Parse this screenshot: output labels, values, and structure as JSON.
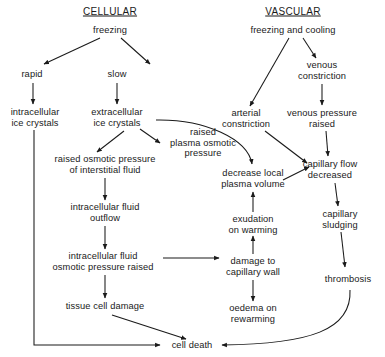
{
  "diagram": {
    "title_cellular": "CELLULAR",
    "title_vascular": "VASCULAR",
    "headings": [
      {
        "id": "cellular",
        "label": "CELLULAR",
        "x": 110,
        "y": 11
      },
      {
        "id": "vascular",
        "label": "VASCULAR",
        "x": 293,
        "y": 11
      }
    ],
    "nodes": [
      {
        "id": "freezing",
        "label": "freezing",
        "x": 110,
        "y": 30
      },
      {
        "id": "rapid",
        "label": "rapid",
        "x": 32,
        "y": 74
      },
      {
        "id": "slow",
        "label": "slow",
        "x": 117,
        "y": 74
      },
      {
        "id": "intracellular-ice-crystals",
        "label": "intracellular\nice crystals",
        "x": 35,
        "y": 117
      },
      {
        "id": "extracellular-ice-crystals",
        "label": "extracellular\nice crystals",
        "x": 117,
        "y": 117
      },
      {
        "id": "raised-plasma-osmotic-pressure",
        "label": "raised\nplasma osmotic\npressure",
        "x": 203,
        "y": 143
      },
      {
        "id": "raised-osmotic-pressure-interstitial",
        "label": "raised osmotic pressure\nof interstitial fluid",
        "x": 105,
        "y": 164
      },
      {
        "id": "intracellular-fluid-outflow",
        "label": "intracellular fluid\noutflow",
        "x": 105,
        "y": 212
      },
      {
        "id": "intracellular-fluid-osmotic-pressure-raised",
        "label": "intracellular fluid\nosmotic pressure raised",
        "x": 103,
        "y": 261
      },
      {
        "id": "tissue-cell-damage",
        "label": "tissue cell damage",
        "x": 105,
        "y": 306
      },
      {
        "id": "cell-death",
        "label": "cell death",
        "x": 192,
        "y": 345
      },
      {
        "id": "freezing-and-cooling",
        "label": "freezing and cooling",
        "x": 293,
        "y": 30
      },
      {
        "id": "venous-constriction",
        "label": "venous\nconstriction",
        "x": 322,
        "y": 70
      },
      {
        "id": "arterial-constriction",
        "label": "arterial\nconstriction",
        "x": 246,
        "y": 118
      },
      {
        "id": "venous-pressure-raised",
        "label": "venous pressure\nraised",
        "x": 322,
        "y": 118
      },
      {
        "id": "capillary-flow-decreased",
        "label": "capillary flow\ndecreased",
        "x": 330,
        "y": 169
      },
      {
        "id": "decrease-local-plasma-volume",
        "label": "decrease local\nplasma volume",
        "x": 253,
        "y": 178
      },
      {
        "id": "exudation-on-warming",
        "label": "exudation\non warming",
        "x": 253,
        "y": 224
      },
      {
        "id": "damage-to-capillary-wall",
        "label": "damage to\ncapillary wall",
        "x": 253,
        "y": 266
      },
      {
        "id": "oedema-on-rewarming",
        "label": "oedema on\nrewarming",
        "x": 253,
        "y": 313
      },
      {
        "id": "capillary-sludging",
        "label": "capillary\nsludging",
        "x": 340,
        "y": 219
      },
      {
        "id": "thrombosis",
        "label": "thrombosis",
        "x": 348,
        "y": 279
      }
    ],
    "edges": [
      {
        "id": "freezing-to-rapid",
        "from": "freezing",
        "to": "rapid"
      },
      {
        "id": "freezing-to-slow",
        "from": "freezing",
        "to": "slow"
      },
      {
        "id": "rapid-to-intracellular",
        "from": "rapid",
        "to": "intracellular-ice-crystals"
      },
      {
        "id": "slow-to-extracellular",
        "from": "slow",
        "to": "extracellular-ice-crystals"
      },
      {
        "id": "extracellular-to-raised-plasma",
        "from": "extracellular-ice-crystals",
        "to": "raised-plasma-osmotic-pressure"
      },
      {
        "id": "extracellular-to-interstitial",
        "from": "extracellular-ice-crystals",
        "to": "raised-osmotic-pressure-interstitial"
      },
      {
        "id": "extracellular-to-decrease-local",
        "from": "extracellular-ice-crystals",
        "to": "decrease-local-plasma-volume"
      },
      {
        "id": "interstitial-to-outflow",
        "from": "raised-osmotic-pressure-interstitial",
        "to": "intracellular-fluid-outflow"
      },
      {
        "id": "outflow-to-osmotic-raised",
        "from": "intracellular-fluid-outflow",
        "to": "intracellular-fluid-osmotic-pressure-raised"
      },
      {
        "id": "osmotic-raised-to-tissue-damage",
        "from": "intracellular-fluid-osmotic-pressure-raised",
        "to": "tissue-cell-damage"
      },
      {
        "id": "osmotic-raised-to-capillary-wall",
        "from": "intracellular-fluid-osmotic-pressure-raised",
        "to": "damage-to-capillary-wall"
      },
      {
        "id": "tissue-damage-to-cell-death",
        "from": "tissue-cell-damage",
        "to": "cell-death"
      },
      {
        "id": "intracellular-ice-to-cell-death",
        "from": "intracellular-ice-crystals",
        "to": "cell-death"
      },
      {
        "id": "freezing-cooling-to-arterial",
        "from": "freezing-and-cooling",
        "to": "arterial-constriction"
      },
      {
        "id": "freezing-cooling-to-venous",
        "from": "freezing-and-cooling",
        "to": "venous-constriction"
      },
      {
        "id": "venous-constriction-to-pressure",
        "from": "venous-constriction",
        "to": "venous-pressure-raised"
      },
      {
        "id": "venous-pressure-to-capillary-flow",
        "from": "venous-pressure-raised",
        "to": "capillary-flow-decreased"
      },
      {
        "id": "arterial-to-capillary-flow",
        "from": "arterial-constriction",
        "to": "capillary-flow-decreased"
      },
      {
        "id": "decrease-local-to-capillary-flow",
        "from": "decrease-local-plasma-volume",
        "to": "capillary-flow-decreased"
      },
      {
        "id": "exudation-to-decrease-local",
        "from": "exudation-on-warming",
        "to": "decrease-local-plasma-volume"
      },
      {
        "id": "capillary-wall-to-exudation",
        "from": "damage-to-capillary-wall",
        "to": "exudation-on-warming"
      },
      {
        "id": "capillary-wall-to-oedema",
        "from": "damage-to-capillary-wall",
        "to": "oedema-on-rewarming"
      },
      {
        "id": "capillary-flow-to-sludging",
        "from": "capillary-flow-decreased",
        "to": "capillary-sludging"
      },
      {
        "id": "sludging-to-thrombosis",
        "from": "capillary-sludging",
        "to": "thrombosis"
      },
      {
        "id": "thrombosis-to-cell-death",
        "from": "thrombosis",
        "to": "cell-death"
      }
    ]
  }
}
